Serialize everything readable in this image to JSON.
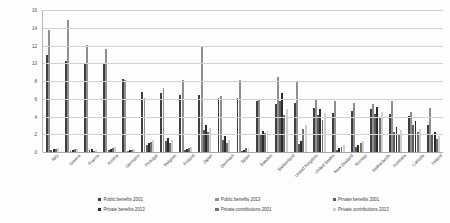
{
  "chart_data": {
    "type": "bar",
    "title": "",
    "subtitle": "",
    "xlabel": "",
    "ylabel": "",
    "ylim": [
      0,
      16
    ],
    "yticks": [
      0,
      2,
      4,
      6,
      8,
      10,
      12,
      14,
      16
    ],
    "grid": true,
    "legend_position": "bottom",
    "categories": [
      "Italy",
      "Greece",
      "France",
      "Austria",
      "Germany",
      "Portugal",
      "Belgium",
      "Finland",
      "Japan",
      "Denmark",
      "Spain",
      "Sweden",
      "Switzerland",
      "United Kingdom",
      "United States",
      "New Zealand",
      "Norway",
      "Netherlands",
      "Australia",
      "Canada",
      "Ireland"
    ],
    "series": [
      {
        "name": "Public benefits 2001",
        "color": "#3f3f3f",
        "values": [
          10.9,
          10.2,
          9.9,
          9.9,
          8.2,
          6.8,
          6.6,
          6.4,
          6.4,
          6.1,
          6.1,
          5.8,
          5.4,
          5.5,
          5.0,
          4.4,
          4.6,
          4.9,
          4.3,
          4.1,
          3.1
        ]
      },
      {
        "name": "Public benefits 2013",
        "color": "#8f8f8f",
        "values": [
          13.7,
          14.9,
          12.1,
          11.6,
          8.1,
          6.1,
          7.2,
          8.1,
          12.0,
          6.3,
          8.1,
          5.9,
          8.5,
          7.9,
          6.0,
          5.8,
          5.5,
          5.4,
          5.7,
          4.5,
          5.0
        ]
      },
      {
        "name": "Private benefits 2001",
        "color": "#5a5a5a",
        "values": [
          0.2,
          0.1,
          0.2,
          0.2,
          0.1,
          0.8,
          1.2,
          0.2,
          2.5,
          1.4,
          0.1,
          1.9,
          5.7,
          0.9,
          4.2,
          0.2,
          0.6,
          4.3,
          2.3,
          3.0,
          1.9
        ]
      },
      {
        "name": "Private benefits 2013",
        "color": "#2b2b2b",
        "values": [
          0.3,
          0.2,
          0.3,
          0.3,
          0.2,
          1.0,
          1.6,
          0.3,
          3.0,
          1.8,
          0.2,
          2.4,
          6.7,
          1.2,
          4.9,
          0.4,
          0.8,
          5.1,
          2.8,
          3.5,
          2.3
        ]
      },
      {
        "name": "Private contributions 2001",
        "color": "#707070",
        "values": [
          0.3,
          0.3,
          0.1,
          0.5,
          0.2,
          1.1,
          1.0,
          0.5,
          2.2,
          1.0,
          0.4,
          2.1,
          4.2,
          2.6,
          3.6,
          0.6,
          1.0,
          3.8,
          2.0,
          2.2,
          1.5
        ]
      },
      {
        "name": "Private contributions 2013",
        "color": "#cfcfcf",
        "values": [
          0.4,
          0.3,
          0.2,
          0.6,
          0.3,
          1.3,
          1.3,
          0.6,
          2.7,
          1.3,
          0.5,
          2.5,
          4.9,
          3.1,
          4.4,
          0.8,
          1.2,
          4.5,
          2.5,
          2.6,
          1.8
        ]
      }
    ]
  }
}
